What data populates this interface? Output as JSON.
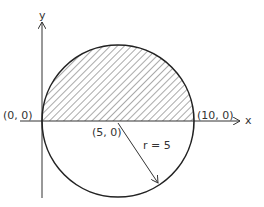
{
  "diagram": {
    "axes": {
      "x_label": "x",
      "y_label": "y"
    },
    "points": {
      "origin": "(0, 0)",
      "center": "(5, 0)",
      "right": "(10, 0)"
    },
    "radius_label": "r = 5",
    "shaded_region": "upper half of circle (hatched)",
    "colors": {
      "stroke": "#333333",
      "hatch": "#555555",
      "background": "#ffffff"
    }
  }
}
